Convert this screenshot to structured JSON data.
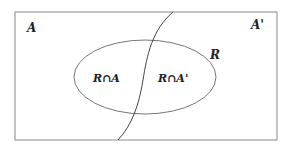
{
  "diagram": {
    "type": "venn",
    "universe_left_label": "A",
    "universe_right_label": "A'",
    "region_label": "R",
    "intersection_left_label": "R∩A",
    "intersection_right_label": "R∩A'",
    "colors": {
      "stroke": "#555555",
      "text": "#222222",
      "background": "#ffffff"
    }
  }
}
